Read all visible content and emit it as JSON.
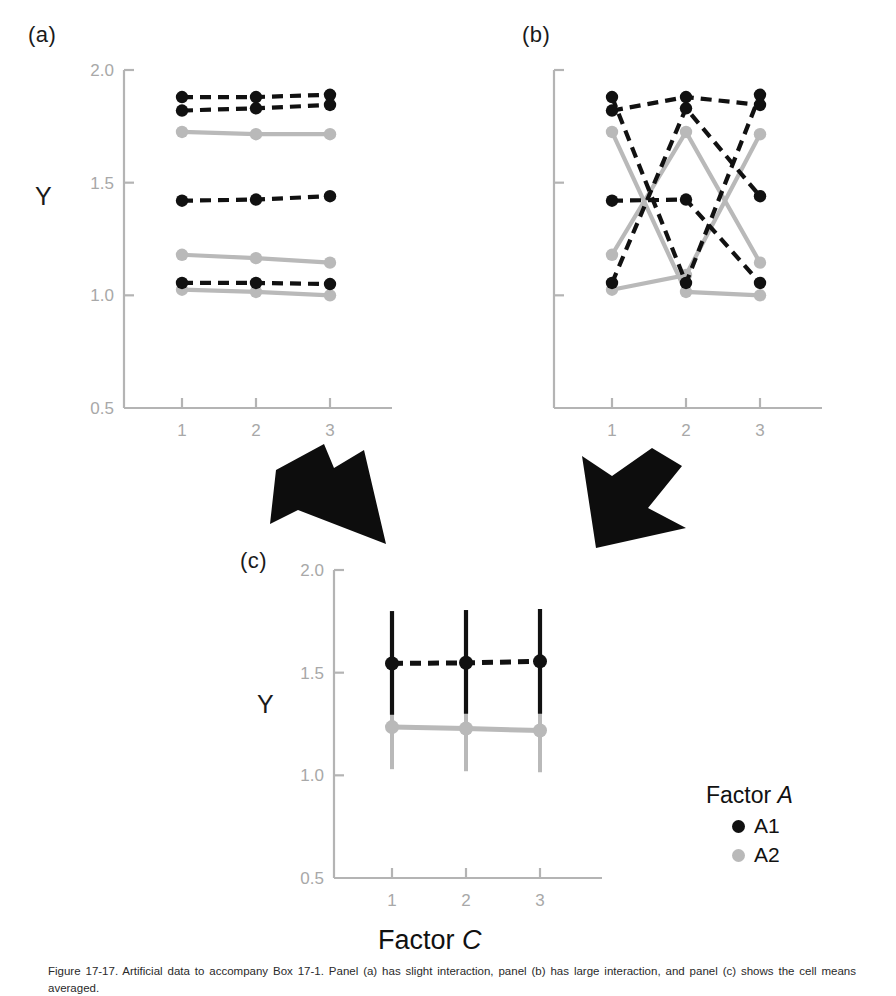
{
  "figure": {
    "panels": [
      {
        "tag": "(a)",
        "ylabel": "Y"
      },
      {
        "tag": "(b)",
        "ylabel": ""
      },
      {
        "tag": "(c)",
        "ylabel": "Y"
      }
    ],
    "xaxis_title": "Factor C",
    "xaxis_title_italic": "C",
    "legend": {
      "title": "Factor A",
      "title_italic": "A",
      "items": [
        {
          "label": "A1",
          "color": "#111111",
          "marker": "filled-circle"
        },
        {
          "label": "A2",
          "color": "#b9b9b9",
          "marker": "filled-circle"
        }
      ]
    },
    "caption": "Figure 17-17. Artificial data to accompany Box 17-1. Panel (a) has slight interaction, panel (b) has large interaction, and panel (c) shows the cell means averaged.",
    "arrows": [
      {
        "name": "arrow-a-to-c",
        "direction": "down-right"
      },
      {
        "name": "arrow-b-to-c",
        "direction": "down-left"
      }
    ],
    "colors": {
      "series_a1": "#111111",
      "series_a2": "#b9b9b9",
      "axis": "#b4b4b4",
      "tick_label": "#a8a8a8",
      "background": "#ffffff"
    }
  },
  "chart_data": [
    {
      "type": "line",
      "panel": "a",
      "title": "(a)",
      "xlabel": "",
      "ylabel": "Y",
      "x": [
        1,
        2,
        3
      ],
      "categories": [
        "1",
        "2",
        "3"
      ],
      "xtick_labels": [
        "1",
        "2",
        "3"
      ],
      "ytick_labels": [
        "0.5",
        "1.0",
        "1.5",
        "2.0"
      ],
      "yticks": [
        0.5,
        1.0,
        1.5,
        2.0
      ],
      "ylim": [
        0.5,
        2.0
      ],
      "grid": false,
      "legend": "none",
      "series": [
        {
          "name": "A1-1",
          "group": "A1",
          "style": "dashed",
          "color": "#111111",
          "values": [
            1.88,
            1.88,
            1.89
          ]
        },
        {
          "name": "A1-2",
          "group": "A1",
          "style": "dashed",
          "color": "#111111",
          "values": [
            1.82,
            1.83,
            1.845
          ]
        },
        {
          "name": "A1-3",
          "group": "A1",
          "style": "dashed",
          "color": "#111111",
          "values": [
            1.42,
            1.425,
            1.44
          ]
        },
        {
          "name": "A1-4",
          "group": "A1",
          "style": "dashed",
          "color": "#111111",
          "values": [
            1.055,
            1.055,
            1.05
          ]
        },
        {
          "name": "A2-1",
          "group": "A2",
          "style": "solid",
          "color": "#b9b9b9",
          "values": [
            1.725,
            1.715,
            1.715
          ]
        },
        {
          "name": "A2-2",
          "group": "A2",
          "style": "solid",
          "color": "#b9b9b9",
          "values": [
            1.18,
            1.165,
            1.145
          ]
        },
        {
          "name": "A2-3",
          "group": "A2",
          "style": "solid",
          "color": "#b9b9b9",
          "values": [
            1.025,
            1.015,
            1.0
          ]
        }
      ]
    },
    {
      "type": "line",
      "panel": "b",
      "title": "(b)",
      "xlabel": "",
      "ylabel": "",
      "x": [
        1,
        2,
        3
      ],
      "categories": [
        "1",
        "2",
        "3"
      ],
      "xtick_labels": [
        "1",
        "2",
        "3"
      ],
      "ytick_labels": [
        "",
        "",
        "",
        ""
      ],
      "yticks": [
        0.5,
        1.0,
        1.5,
        2.0
      ],
      "ylim": [
        0.5,
        2.0
      ],
      "grid": false,
      "legend": "none",
      "series": [
        {
          "name": "A1-1",
          "group": "A1",
          "style": "dashed",
          "color": "#111111",
          "values": [
            1.88,
            1.055,
            1.89
          ]
        },
        {
          "name": "A1-2",
          "group": "A1",
          "style": "dashed",
          "color": "#111111",
          "values": [
            1.82,
            1.88,
            1.845
          ]
        },
        {
          "name": "A1-3",
          "group": "A1",
          "style": "dashed",
          "color": "#111111",
          "values": [
            1.42,
            1.425,
            1.055
          ]
        },
        {
          "name": "A1-4",
          "group": "A1",
          "style": "dashed",
          "color": "#111111",
          "values": [
            1.055,
            1.83,
            1.44
          ]
        },
        {
          "name": "A2-1",
          "group": "A2",
          "style": "solid",
          "color": "#b9b9b9",
          "values": [
            1.725,
            1.015,
            1.0
          ]
        },
        {
          "name": "A2-2",
          "group": "A2",
          "style": "solid",
          "color": "#b9b9b9",
          "values": [
            1.18,
            1.725,
            1.145
          ]
        },
        {
          "name": "A2-3",
          "group": "A2",
          "style": "solid",
          "color": "#b9b9b9",
          "values": [
            1.025,
            1.09,
            1.715
          ]
        }
      ]
    },
    {
      "type": "line",
      "panel": "c",
      "title": "(c)",
      "xlabel": "Factor C",
      "ylabel": "Y",
      "x": [
        1,
        2,
        3
      ],
      "categories": [
        "1",
        "2",
        "3"
      ],
      "xtick_labels": [
        "1",
        "2",
        "3"
      ],
      "ytick_labels": [
        "0.5",
        "1.0",
        "1.5",
        "2.0"
      ],
      "yticks": [
        0.5,
        1.0,
        1.5,
        2.0
      ],
      "ylim": [
        0.5,
        2.0
      ],
      "grid": false,
      "legend": "Factor A",
      "errorbars": true,
      "series": [
        {
          "name": "A1",
          "group": "A1",
          "style": "dashed",
          "color": "#111111",
          "values": [
            1.545,
            1.548,
            1.555
          ],
          "err_low": [
            1.295,
            1.3,
            1.3
          ],
          "err_high": [
            1.8,
            1.805,
            1.81
          ]
        },
        {
          "name": "A2",
          "group": "A2",
          "style": "solid",
          "color": "#b9b9b9",
          "values": [
            1.235,
            1.228,
            1.218
          ],
          "err_low": [
            1.03,
            1.02,
            1.015
          ],
          "err_high": [
            1.435,
            1.43,
            1.425
          ]
        }
      ]
    }
  ]
}
